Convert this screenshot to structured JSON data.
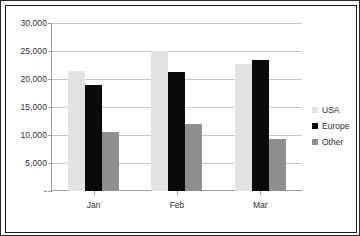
{
  "chart_data": {
    "type": "bar",
    "title": "",
    "subtitle": "",
    "xlabel": "",
    "ylabel": "",
    "categories": [
      "Jan",
      "Feb",
      "Mar"
    ],
    "series": [
      {
        "name": "USA",
        "color": "#e2e2e2",
        "values": [
          21500,
          25000,
          22600
        ]
      },
      {
        "name": "Europe",
        "color": "#0a0a0a",
        "values": [
          19000,
          21300,
          23400
        ]
      },
      {
        "name": "Other",
        "color": "#8f8f8f",
        "values": [
          10600,
          11900,
          9300
        ]
      }
    ],
    "ylim": [
      0,
      30000
    ],
    "yticks": [
      0,
      5000,
      10000,
      15000,
      20000,
      25000,
      30000
    ],
    "ytick_labels": [
      "-",
      "5,000",
      "10,000",
      "15,000",
      "20,000",
      "25,000",
      "30,000"
    ],
    "grid": true,
    "legend_position": "right",
    "annotations": []
  },
  "axes": {
    "y_tick_labels": [
      {
        "value": 30000,
        "label": "30,000"
      },
      {
        "value": 25000,
        "label": "25,000"
      },
      {
        "value": 20000,
        "label": "20,000"
      },
      {
        "value": 15000,
        "label": "15,000"
      },
      {
        "value": 10000,
        "label": "10,000"
      },
      {
        "value": 5000,
        "label": "5,000"
      },
      {
        "value": 0,
        "label": "-"
      }
    ],
    "x_tick_labels": [
      "Jan",
      "Feb",
      "Mar"
    ]
  },
  "legend": {
    "items": [
      {
        "label": "USA",
        "color": "#e2e2e2"
      },
      {
        "label": "Europe",
        "color": "#0a0a0a"
      },
      {
        "label": "Other",
        "color": "#8f8f8f"
      }
    ]
  }
}
